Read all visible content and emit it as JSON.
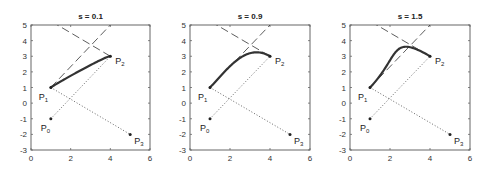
{
  "chart_data": [
    {
      "type": "line",
      "title": "s = 0.1",
      "s": 0.1,
      "xlim": [
        0,
        6
      ],
      "ylim": [
        -3,
        5
      ],
      "xticks": [
        0,
        2,
        4,
        6
      ],
      "yticks": [
        -3,
        -2,
        -1,
        0,
        1,
        2,
        3,
        4,
        5
      ],
      "points": {
        "P0": [
          1,
          -1
        ],
        "P1": [
          1,
          1
        ],
        "P2": [
          4,
          3
        ],
        "P3": [
          5,
          -2
        ]
      },
      "series": [
        {
          "name": "curve",
          "style": "solid-thick",
          "from": "P1",
          "to": "P2"
        },
        {
          "name": "chord P0-P2",
          "style": "dotted"
        },
        {
          "name": "chord P1-P3",
          "style": "dotted"
        },
        {
          "name": "tangent at P1",
          "style": "dashed"
        },
        {
          "name": "tangent at P2",
          "style": "dashed"
        }
      ]
    },
    {
      "type": "line",
      "title": "s = 0.9",
      "s": 0.9,
      "xlim": [
        0,
        6
      ],
      "ylim": [
        -3,
        5
      ],
      "xticks": [
        0,
        2,
        4,
        6
      ],
      "yticks": [
        -3,
        -2,
        -1,
        0,
        1,
        2,
        3,
        4,
        5
      ],
      "points": {
        "P0": [
          1,
          -1
        ],
        "P1": [
          1,
          1
        ],
        "P2": [
          4,
          3
        ],
        "P3": [
          5,
          -2
        ]
      }
    },
    {
      "type": "line",
      "title": "s = 1.5",
      "s": 1.5,
      "xlim": [
        0,
        6
      ],
      "ylim": [
        -3,
        5
      ],
      "xticks": [
        0,
        2,
        4,
        6
      ],
      "yticks": [
        -3,
        -2,
        -1,
        0,
        1,
        2,
        3,
        4,
        5
      ],
      "points": {
        "P0": [
          1,
          -1
        ],
        "P1": [
          1,
          1
        ],
        "P2": [
          4,
          3
        ],
        "P3": [
          5,
          -2
        ]
      }
    }
  ],
  "panels": [
    {
      "left": 31,
      "top": 25,
      "width": 119,
      "height": 125
    },
    {
      "left": 190,
      "top": 25,
      "width": 120,
      "height": 125
    },
    {
      "left": 350,
      "top": 25,
      "width": 120,
      "height": 125
    }
  ],
  "labels": {
    "P": "P",
    "subs": [
      "0",
      "1",
      "2",
      "3"
    ]
  }
}
